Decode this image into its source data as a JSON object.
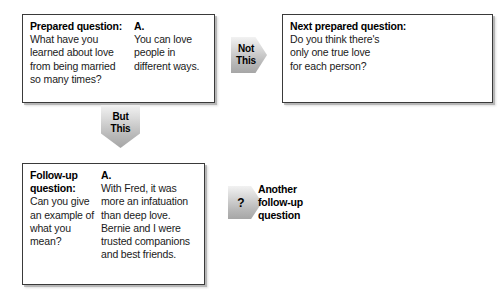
{
  "diagram": {
    "type": "interview-question-flowchart",
    "boxes": [
      {
        "id": "prepared-question",
        "label": "Prepared question:",
        "question": "What have you\nlearned about love\nfrom being married\nso many times?",
        "answer_label": "A.",
        "answer": "You can love\npeople in\ndifferent ways."
      },
      {
        "id": "next-prepared-question",
        "label": "Next prepared\nquestion:",
        "question": "Do you think there's\nonly one true love\nfor each person?",
        "answer_label": "",
        "answer": ""
      },
      {
        "id": "follow-up-question",
        "label": "Follow-up\nquestion:",
        "question": "Can you give\nan example of\nwhat you\nmean?",
        "answer_label": "A.",
        "answer": "With Fred, it was\nmore an infatuation\nthan deep love.\nBernie and I were\ntrusted companions\nand best friends."
      }
    ],
    "arrows": [
      {
        "id": "not-this",
        "label": "Not\nThis",
        "direction": "right"
      },
      {
        "id": "but-this",
        "label": "But\nThis",
        "direction": "down"
      },
      {
        "id": "question-mark",
        "label": "?",
        "direction": "right"
      }
    ],
    "free_labels": [
      {
        "id": "another-follow-up",
        "text": "Another\nfollow-up\nquestion"
      }
    ],
    "colors": {
      "box_border": "#3a3a3a",
      "box_background": "#ffffff",
      "arrow_fill_light": "#f2f2f2",
      "arrow_fill_dark": "#a6a6a6",
      "text": "#111111"
    }
  }
}
